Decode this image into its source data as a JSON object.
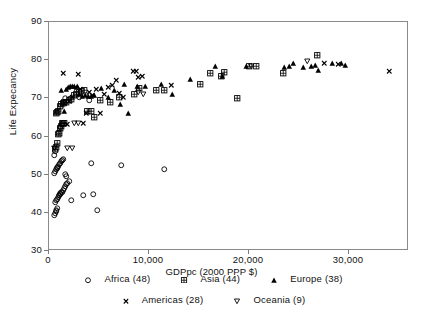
{
  "chart_data": {
    "type": "scatter",
    "title": "",
    "xlabel": "GDPpc (2000 PPP  $)",
    "ylabel": "Life Expecancy",
    "xlim": [
      0,
      36000
    ],
    "ylim": [
      30,
      90
    ],
    "xticks": [
      0,
      10000,
      20000,
      30000
    ],
    "xtick_labels": [
      "0",
      "10,000",
      "20,000",
      "30,000"
    ],
    "yticks": [
      30,
      40,
      50,
      60,
      70,
      80,
      90
    ],
    "ytick_labels": [
      "30",
      "40",
      "50",
      "60",
      "70",
      "80",
      "90"
    ],
    "grid": false,
    "legend_position": "bottom",
    "series": [
      {
        "name": "Africa (48)",
        "label": "Africa (48)",
        "marker": "open-circle",
        "count": 48,
        "points": [
          [
            620,
            39.3
          ],
          [
            700,
            39.8
          ],
          [
            760,
            40.3
          ],
          [
            830,
            40.6
          ],
          [
            880,
            41.0
          ],
          [
            700,
            42.5
          ],
          [
            820,
            43.0
          ],
          [
            900,
            43.4
          ],
          [
            980,
            43.8
          ],
          [
            1050,
            44.3
          ],
          [
            1120,
            44.5
          ],
          [
            1180,
            44.7
          ],
          [
            1240,
            44.9
          ],
          [
            1300,
            45.1
          ],
          [
            1380,
            45.3
          ],
          [
            1460,
            45.8
          ],
          [
            1560,
            46.3
          ],
          [
            1660,
            46.8
          ],
          [
            1780,
            47.3
          ],
          [
            1900,
            47.6
          ],
          [
            2050,
            48.0
          ],
          [
            2250,
            43.0
          ],
          [
            3450,
            44.4
          ],
          [
            4450,
            44.8
          ],
          [
            4900,
            40.4
          ],
          [
            640,
            50.3
          ],
          [
            700,
            50.8
          ],
          [
            780,
            51.2
          ],
          [
            860,
            51.5
          ],
          [
            930,
            51.8
          ],
          [
            1000,
            52.1
          ],
          [
            1090,
            52.5
          ],
          [
            1180,
            52.9
          ],
          [
            1280,
            53.3
          ],
          [
            1400,
            53.6
          ],
          [
            1530,
            53.9
          ],
          [
            1660,
            50.0
          ],
          [
            1820,
            49.3
          ],
          [
            620,
            55.0
          ],
          [
            700,
            56.0
          ],
          [
            1150,
            62.2
          ],
          [
            1400,
            63.0
          ],
          [
            1700,
            69.8
          ],
          [
            3100,
            70.0
          ],
          [
            4050,
            69.4
          ],
          [
            4300,
            52.9
          ],
          [
            7300,
            52.2
          ],
          [
            11600,
            51.1
          ]
        ]
      },
      {
        "name": "Asia (44)",
        "label": "Asia (44)",
        "marker": "square-cross",
        "count": 44,
        "points": [
          [
            680,
            56.4
          ],
          [
            760,
            57.0
          ],
          [
            860,
            58.0
          ],
          [
            950,
            60.4
          ],
          [
            1050,
            60.7
          ],
          [
            1150,
            61.9
          ],
          [
            1260,
            62.6
          ],
          [
            1380,
            63.2
          ],
          [
            1480,
            63.3
          ],
          [
            1600,
            63.4
          ],
          [
            780,
            65.9
          ],
          [
            900,
            66.2
          ],
          [
            1000,
            66.5
          ],
          [
            1180,
            67.7
          ],
          [
            1320,
            68.2
          ],
          [
            1480,
            68.5
          ],
          [
            1620,
            68.8
          ],
          [
            1800,
            68.9
          ],
          [
            2050,
            69.2
          ],
          [
            2300,
            69.5
          ],
          [
            2560,
            70.6
          ],
          [
            2820,
            71.0
          ],
          [
            3050,
            71.4
          ],
          [
            3300,
            71.7
          ],
          [
            3600,
            71.9
          ],
          [
            3850,
            66.3
          ],
          [
            4250,
            66.4
          ],
          [
            4600,
            64.8
          ],
          [
            5200,
            69.2
          ],
          [
            6150,
            68.8
          ],
          [
            7100,
            70.0
          ],
          [
            8600,
            70.9
          ],
          [
            9100,
            72.5
          ],
          [
            10800,
            71.8
          ],
          [
            11600,
            71.8
          ],
          [
            15200,
            73.4
          ],
          [
            16200,
            76.4
          ],
          [
            17300,
            75.5
          ],
          [
            17600,
            76.6
          ],
          [
            18900,
            69.8
          ],
          [
            20100,
            78.2
          ],
          [
            20800,
            78.2
          ],
          [
            23500,
            76.5
          ],
          [
            26900,
            81.0
          ]
        ]
      },
      {
        "name": "Europe (38)",
        "label": "Europe (38)",
        "marker": "filled-triangle",
        "count": 38,
        "points": [
          [
            1320,
            71.9
          ],
          [
            1600,
            66.5
          ],
          [
            1750,
            72.3
          ],
          [
            1950,
            72.6
          ],
          [
            2150,
            72.9
          ],
          [
            2350,
            73.1
          ],
          [
            2600,
            72.9
          ],
          [
            2850,
            73.0
          ],
          [
            3100,
            71.0
          ],
          [
            3400,
            70.3
          ],
          [
            3700,
            70.7
          ],
          [
            4000,
            70.4
          ],
          [
            4300,
            70.4
          ],
          [
            4600,
            70.6
          ],
          [
            5300,
            72.5
          ],
          [
            6000,
            70.1
          ],
          [
            6600,
            71.9
          ],
          [
            7200,
            68.2
          ],
          [
            7600,
            73.6
          ],
          [
            8000,
            66.0
          ],
          [
            8900,
            73.0
          ],
          [
            9700,
            72.9
          ],
          [
            11300,
            73.4
          ],
          [
            12400,
            71.0
          ],
          [
            14200,
            74.8
          ],
          [
            16700,
            78.1
          ],
          [
            17400,
            75.5
          ],
          [
            19800,
            78.3
          ],
          [
            23600,
            77.9
          ],
          [
            24100,
            78.3
          ],
          [
            24500,
            79.0
          ],
          [
            25500,
            77.9
          ],
          [
            26300,
            78.3
          ],
          [
            26700,
            78.4
          ],
          [
            27000,
            77.2
          ],
          [
            28400,
            79.0
          ],
          [
            29300,
            79.0
          ],
          [
            29700,
            78.4
          ]
        ]
      },
      {
        "name": "Americas (28)",
        "label": "Americas (28)",
        "marker": "x-cross",
        "count": 28,
        "points": [
          [
            1450,
            76.3
          ],
          [
            1600,
            68.5
          ],
          [
            1850,
            63.0
          ],
          [
            2100,
            69.0
          ],
          [
            2400,
            70.0
          ],
          [
            2750,
            72.5
          ],
          [
            3000,
            76.0
          ],
          [
            3200,
            72.2
          ],
          [
            3500,
            63.3
          ],
          [
            3800,
            66.0
          ],
          [
            4100,
            71.5
          ],
          [
            4400,
            70.6
          ],
          [
            4800,
            72.2
          ],
          [
            5200,
            66.0
          ],
          [
            5600,
            70.8
          ],
          [
            6000,
            72.8
          ],
          [
            6400,
            73.3
          ],
          [
            6800,
            74.5
          ],
          [
            7100,
            71.1
          ],
          [
            7500,
            70.0
          ],
          [
            8500,
            76.9
          ],
          [
            8800,
            77.0
          ],
          [
            9000,
            75.2
          ],
          [
            9400,
            75.6
          ],
          [
            12300,
            73.3
          ],
          [
            27600,
            79.1
          ],
          [
            29000,
            78.8
          ],
          [
            34100,
            77.0
          ]
        ]
      },
      {
        "name": "Oceania (9)",
        "label": "Oceania (9)",
        "marker": "open-down-triangle",
        "count": 9,
        "points": [
          [
            620,
            56.8
          ],
          [
            1900,
            56.6
          ],
          [
            2350,
            56.6
          ],
          [
            2600,
            63.2
          ],
          [
            3000,
            63.3
          ],
          [
            9000,
            71.3
          ],
          [
            9500,
            70.9
          ],
          [
            20300,
            78.1
          ],
          [
            25900,
            79.5
          ]
        ]
      }
    ]
  },
  "axes": {
    "x_title": "GDPpc (2000 PPP  $)",
    "y_title": "Life Expecancy"
  },
  "colors": {
    "marker": "#000000",
    "axis": "#7d7d7d",
    "background": "#ffffff"
  }
}
